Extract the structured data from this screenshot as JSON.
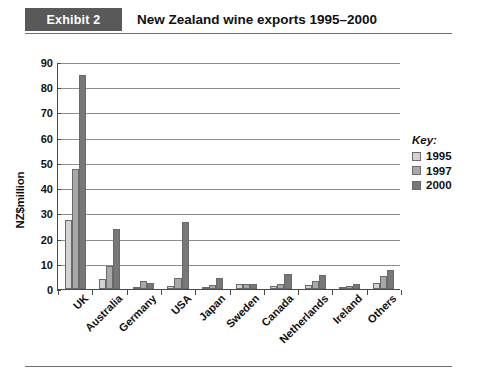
{
  "header": {
    "tag": "Exhibit 2",
    "title": "New Zealand wine exports 1995–2000"
  },
  "chart_data": {
    "type": "bar",
    "title": "New Zealand wine exports 1995–2000",
    "xlabel": "",
    "ylabel": "NZ$million",
    "ylim": [
      0,
      90
    ],
    "ytick_step": 10,
    "yticks": [
      0,
      10,
      20,
      30,
      40,
      50,
      60,
      70,
      80,
      90
    ],
    "grid": true,
    "legend_position": "right",
    "legend_title": "Key:",
    "categories": [
      "UK",
      "Australia",
      "Germany",
      "USA",
      "Japan",
      "Sweden",
      "Canada",
      "Netherlands",
      "Ireland",
      "Others"
    ],
    "series": [
      {
        "name": "1995",
        "color": "#d3d3d3",
        "values": [
          27.5,
          3.8,
          0.3,
          1.0,
          0.6,
          2.0,
          1.0,
          1.5,
          0.7,
          2.5
        ]
      },
      {
        "name": "1997",
        "color": "#a8a8a8",
        "values": [
          47.5,
          9.0,
          3.0,
          4.5,
          1.5,
          2.0,
          2.0,
          3.0,
          1.2,
          5.0
        ]
      },
      {
        "name": "2000",
        "color": "#787878",
        "values": [
          85.0,
          23.8,
          2.5,
          26.5,
          4.5,
          1.8,
          6.0,
          5.5,
          2.0,
          7.5
        ]
      }
    ]
  },
  "colors": {
    "header_tag_background": "#595959",
    "axis": "#4a4a4a",
    "gridline": "#8d8d8d"
  }
}
